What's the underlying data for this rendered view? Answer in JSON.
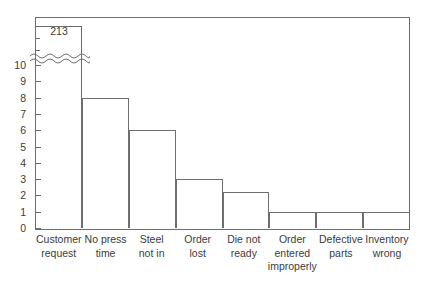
{
  "chart_data": {
    "type": "bar",
    "title": "",
    "xlabel": "",
    "ylabel": "",
    "categories": [
      "Customer request",
      "No press time",
      "Steel not in",
      "Order lost",
      "Die not ready",
      "Order entered improperly",
      "Defective parts",
      "Inventory wrong"
    ],
    "values": [
      213,
      8,
      6,
      3,
      2.2,
      1,
      1,
      1
    ],
    "value_labels": [
      "213",
      "",
      "",
      "",
      "",
      "",
      "",
      ""
    ],
    "ylim": [
      0,
      11
    ],
    "yticks": [
      0,
      1,
      2,
      3,
      4,
      5,
      6,
      7,
      8,
      9,
      10
    ],
    "ytick_labels": [
      "0",
      "1",
      "2",
      "3",
      "4",
      "5",
      "6",
      "7",
      "8",
      "9",
      "10"
    ],
    "axis_break": true,
    "axis_break_note": "y-axis broken above 10; first bar value 213 drawn clipped",
    "grid": false,
    "legend": false,
    "frame": true,
    "bar_style": "outline",
    "colors": {
      "line": "#6e6e6e",
      "text": "#3c3c3c",
      "background": "#ffffff"
    }
  },
  "labels": {
    "cat0_line1": "Customer",
    "cat0_line2": "request",
    "cat1_line1": "No press",
    "cat1_line2": "time",
    "cat2_line1": "Steel",
    "cat2_line2": "not in",
    "cat3_line1": "Order",
    "cat3_line2": "lost",
    "cat4_line1": "Die not",
    "cat4_line2": "ready",
    "cat5_line1": "Order",
    "cat5_line2": "entered",
    "cat5_line3": "improperly",
    "cat6_line1": "Defective",
    "cat6_line2": "parts",
    "cat7_line1": "Inventory",
    "cat7_line2": "wrong"
  },
  "yticks": {
    "t0": "0",
    "t1": "1",
    "t2": "2",
    "t3": "3",
    "t4": "4",
    "t5": "5",
    "t6": "6",
    "t7": "7",
    "t8": "8",
    "t9": "9",
    "t10": "10"
  },
  "annotations": {
    "first_bar_value": "213"
  }
}
